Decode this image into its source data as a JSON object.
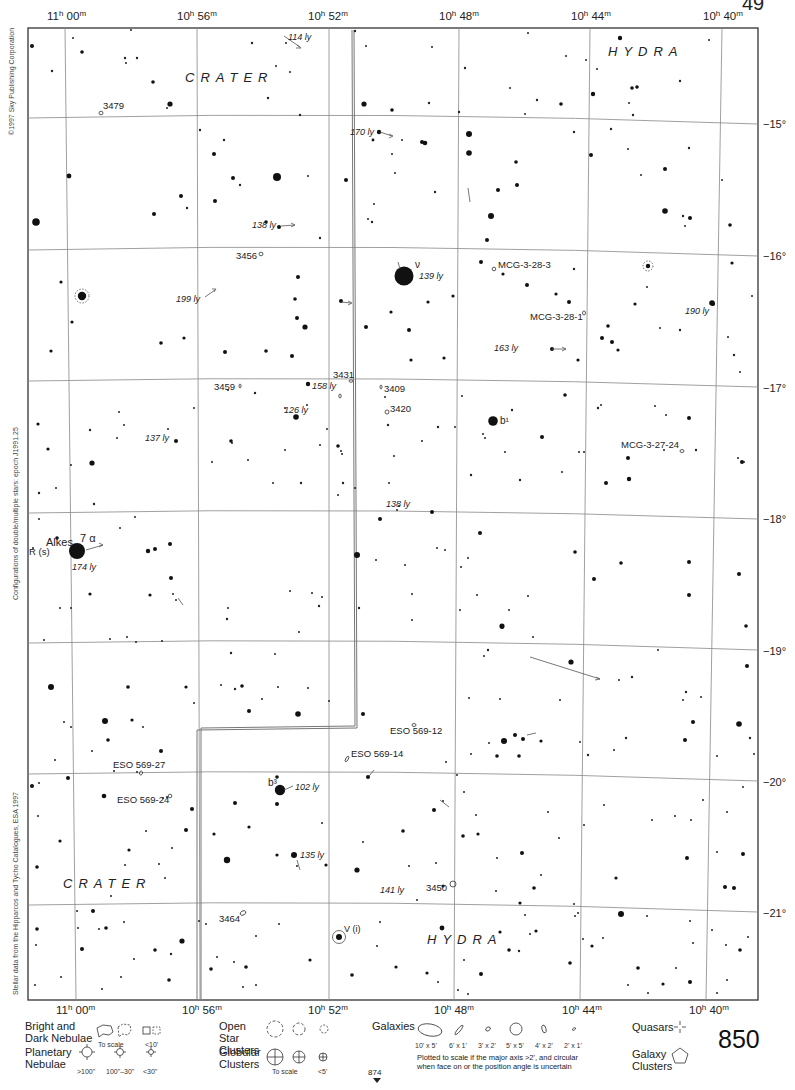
{
  "chart": {
    "page_number": "850",
    "top_corner_fragment": "49",
    "next_page_below": "874",
    "copyright": "©1997 Sky Publishing Corporation",
    "side_note_configurations": "Configurations of double/multiple stars: epoch J1991.25",
    "side_note_source": "Stellar data from the Hipparcos and Tycho Catalogues, ESA 1997",
    "ra_labels": [
      {
        "h": "11",
        "m": "00",
        "x": 67
      },
      {
        "h": "10",
        "m": "56",
        "x": 197
      },
      {
        "h": "10",
        "m": "52",
        "x": 330
      },
      {
        "h": "10",
        "m": "48",
        "x": 456
      },
      {
        "h": "10",
        "m": "44",
        "x": 590
      },
      {
        "h": "10",
        "m": "40",
        "x": 722
      }
    ],
    "dec_labels": [
      {
        "text": "−15°",
        "y": 118
      },
      {
        "text": "−16°",
        "y": 250
      },
      {
        "text": "−17°",
        "y": 382
      },
      {
        "text": "−18°",
        "y": 513
      },
      {
        "text": "−19°",
        "y": 645
      },
      {
        "text": "−20°",
        "y": 776
      },
      {
        "text": "−21°",
        "y": 908
      }
    ],
    "constellations": [
      {
        "name": "CRATER",
        "x": 185,
        "y": 82
      },
      {
        "name": "HYDRA",
        "x": 608,
        "y": 56
      },
      {
        "name": "CRATER",
        "x": 63,
        "y": 888
      },
      {
        "name": "HYDRA",
        "x": 427,
        "y": 944
      }
    ],
    "named_stars": [
      {
        "label": "Alkes",
        "x": 46,
        "y": 546
      },
      {
        "label": "7 α",
        "x": 80,
        "y": 542
      },
      {
        "label": "R (s)",
        "x": 29,
        "y": 553
      },
      {
        "label": "ν",
        "x": 416,
        "y": 268
      },
      {
        "label": "b¹",
        "x": 500,
        "y": 422
      },
      {
        "label": "b³",
        "x": 269,
        "y": 786
      },
      {
        "label": "V (i)",
        "x": 343,
        "y": 932
      }
    ],
    "distance_labels": [
      {
        "text": "114 ly",
        "x": 288,
        "y": 40
      },
      {
        "text": "170 ly",
        "x": 350,
        "y": 135
      },
      {
        "text": "138 ly",
        "x": 252,
        "y": 228
      },
      {
        "text": "139 ly",
        "x": 419,
        "y": 279
      },
      {
        "text": "199 ly",
        "x": 176,
        "y": 302
      },
      {
        "text": "190 ly",
        "x": 685,
        "y": 314
      },
      {
        "text": "163 ly",
        "x": 494,
        "y": 351
      },
      {
        "text": "158 ly",
        "x": 312,
        "y": 389
      },
      {
        "text": "126 ly",
        "x": 284,
        "y": 413
      },
      {
        "text": "137 ly",
        "x": 145,
        "y": 441
      },
      {
        "text": "138 ly",
        "x": 386,
        "y": 507
      },
      {
        "text": "174 ly",
        "x": 72,
        "y": 570
      },
      {
        "text": "102 ly",
        "x": 295,
        "y": 790
      },
      {
        "text": "135 ly",
        "x": 300,
        "y": 858
      },
      {
        "text": "141 ly",
        "x": 380,
        "y": 893
      }
    ],
    "deep_sky": [
      {
        "label": "3479",
        "x": 102,
        "y": 109,
        "sym": "galaxy"
      },
      {
        "label": "3456",
        "x": 236,
        "y": 259,
        "sym": "galaxy"
      },
      {
        "label": "MCG-3-28-3",
        "x": 498,
        "y": 268,
        "sym": "galaxy"
      },
      {
        "label": "MCG-3-28-1",
        "x": 530,
        "y": 320,
        "sym": "galaxy"
      },
      {
        "label": "3459",
        "x": 214,
        "y": 390,
        "sym": "galaxy"
      },
      {
        "label": "3431",
        "x": 333,
        "y": 378,
        "sym": "galaxy"
      },
      {
        "label": "3409",
        "x": 384,
        "y": 392,
        "sym": "galaxy"
      },
      {
        "label": "3420",
        "x": 390,
        "y": 412,
        "sym": "galaxy"
      },
      {
        "label": "MCG-3-27-24",
        "x": 621,
        "y": 448,
        "sym": "galaxy"
      },
      {
        "label": "ESO 569-12",
        "x": 390,
        "y": 734,
        "sym": "galaxy"
      },
      {
        "label": "ESO 569-14",
        "x": 351,
        "y": 757,
        "sym": "galaxy"
      },
      {
        "label": "ESO 569-27",
        "x": 113,
        "y": 768,
        "sym": "galaxy"
      },
      {
        "label": "ESO 569-24",
        "x": 117,
        "y": 803,
        "sym": "galaxy"
      },
      {
        "label": "3450",
        "x": 426,
        "y": 891,
        "sym": "galaxy"
      },
      {
        "label": "3464",
        "x": 219,
        "y": 922,
        "sym": "galaxy"
      }
    ],
    "legend": {
      "nebulae_title": "Bright and Dark Nebulae",
      "nebulae_to_scale": "To scale",
      "nebulae_small": "<10'",
      "planetary_title": "Planetary Nebulae",
      "planetary_sizes": [
        ">100\"",
        "100\"–30\"",
        "<30\""
      ],
      "open_clusters_title": "Open Star Clusters",
      "globular_title": "Globular Clusters",
      "globular_to_scale": "To scale",
      "globular_small": "<5'",
      "galaxies_title": "Galaxies",
      "galaxy_sizes": [
        "10' x 5'",
        "6' x 1'",
        "3' x 2'",
        "5' x 5'",
        "4' x 2'",
        "2' x 1'"
      ],
      "galaxy_note": "Plotted to scale if the major axis >2', and circular when face on or the position angle is uncertain",
      "quasars_title": "Quasars",
      "galaxy_clusters_title": "Galaxy Clusters"
    }
  }
}
